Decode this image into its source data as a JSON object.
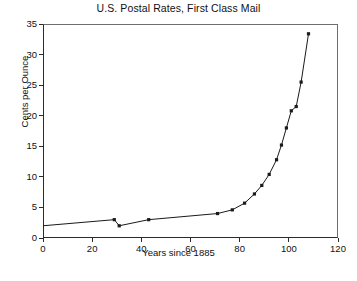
{
  "chart_data": {
    "type": "line",
    "title": "U.S. Postal Rates, First Class Mail",
    "xlabel": "Years since 1885",
    "ylabel": "Cents per Ounce",
    "xlim": [
      0,
      120
    ],
    "ylim": [
      0,
      35
    ],
    "xticks": [
      0,
      20,
      40,
      60,
      80,
      100,
      120
    ],
    "yticks": [
      0,
      5,
      10,
      15,
      20,
      25,
      30,
      35
    ],
    "grid": false,
    "legend": false,
    "marker": "square",
    "line_color": "#1a1a1a",
    "series": [
      {
        "name": "First Class Mail rate",
        "x": [
          0,
          29,
          31,
          43,
          71,
          77,
          82,
          86,
          89,
          92,
          95,
          97,
          99,
          101,
          103,
          105,
          108
        ],
        "values": [
          2,
          3,
          2,
          3,
          4,
          4.6,
          5.7,
          7.2,
          8.6,
          10.4,
          12.8,
          15.2,
          18,
          20.8,
          21.5,
          25.5,
          33.4
        ]
      }
    ]
  }
}
